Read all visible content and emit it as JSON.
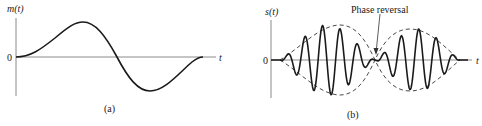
{
  "figure": {
    "panel_a": {
      "ylabel": "m(t)",
      "xlabel": "t",
      "zero_label": "0",
      "caption": "(a)",
      "description": "Baseband message signal: one smooth positive lobe followed by one negative lobe"
    },
    "panel_b": {
      "ylabel": "s(t)",
      "xlabel": "t",
      "zero_label": "0",
      "caption": "(b)",
      "annotation": "Phase reversal",
      "description": "DSB-SC modulated signal with dashed envelope ±|m(t)|; carrier phase reverses at the zero crossing of m(t)"
    },
    "colors": {
      "curve": "#1a1a1a",
      "axis": "#8a8a8a",
      "envelope": "#333333",
      "background": "#ffffff"
    }
  }
}
